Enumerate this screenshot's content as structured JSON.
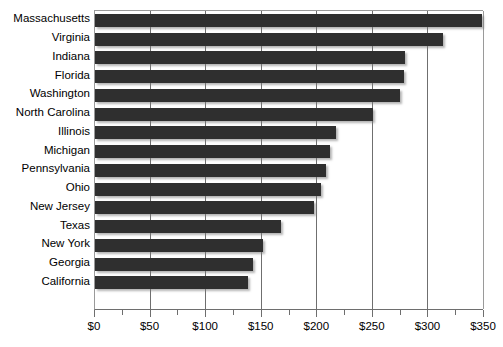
{
  "chart_data": {
    "type": "bar",
    "orientation": "horizontal",
    "title": "",
    "subtitle": "",
    "xlabel": "",
    "ylabel": "",
    "xlim": [
      0,
      350
    ],
    "ylim": null,
    "grid": true,
    "legend": null,
    "legend_position": "none",
    "bar_color": "#2f2f2f",
    "gridline_color": "#6f6f6f",
    "axis_color": "#6e6e6e",
    "tick_prefix": "$",
    "x_major_step": 50,
    "x_minor_step": 25,
    "x_tick_labels": [
      "$0",
      "$50",
      "$100",
      "$150",
      "$200",
      "$250",
      "$300",
      "$350"
    ],
    "x_tick_values": [
      0,
      50,
      100,
      150,
      200,
      250,
      300,
      350
    ],
    "categories": [
      "Massachusetts",
      "Virginia",
      "Indiana",
      "Florida",
      "Washington",
      "North Carolina",
      "Illinois",
      "Michigan",
      "Pennsylvania",
      "Ohio",
      "New Jersey",
      "Texas",
      "New York",
      "Georgia",
      "California"
    ],
    "values": [
      348,
      313,
      279,
      278,
      274,
      250,
      217,
      211,
      208,
      203,
      197,
      167,
      151,
      142,
      138
    ]
  }
}
